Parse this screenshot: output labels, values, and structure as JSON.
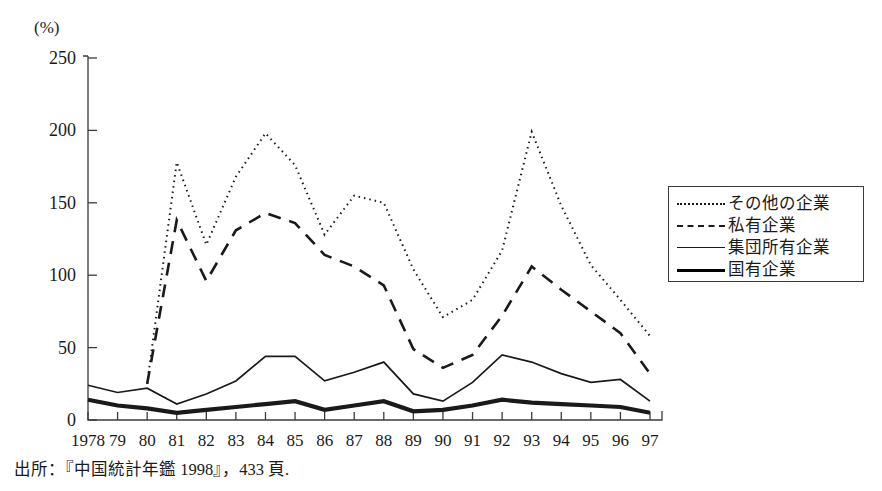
{
  "axis": {
    "y_unit_label": "(%)",
    "y_ticks": [
      0,
      50,
      100,
      150,
      200,
      250
    ],
    "x_tick_labels": [
      "1978",
      "79",
      "80",
      "81",
      "82",
      "83",
      "84",
      "85",
      "86",
      "87",
      "88",
      "89",
      "90",
      "91",
      "92",
      "93",
      "94",
      "95",
      "96",
      "97"
    ]
  },
  "legend": {
    "items": [
      {
        "label": "その他の企業",
        "style": "dotted"
      },
      {
        "label": "私有企業",
        "style": "dashed"
      },
      {
        "label": "集団所有企業",
        "style": "thin-solid"
      },
      {
        "label": "国有企業",
        "style": "thick-solid"
      }
    ]
  },
  "source": {
    "text": "出所：『中国統計年鑑 1998』，433 頁."
  },
  "colors": {
    "line": "#1a1a1a",
    "axis": "#3b3b3b",
    "background": "#ffffff"
  },
  "chart_data": {
    "type": "line",
    "title": "",
    "xlabel": "",
    "ylabel": "(%)",
    "ylim": [
      0,
      250
    ],
    "grid": false,
    "legend_position": "right",
    "categories": [
      "1978",
      "79",
      "80",
      "81",
      "82",
      "83",
      "84",
      "85",
      "86",
      "87",
      "88",
      "89",
      "90",
      "91",
      "92",
      "93",
      "94",
      "95",
      "96",
      "97"
    ],
    "series": [
      {
        "name": "その他の企業",
        "style": "dotted",
        "values": [
          null,
          null,
          25,
          178,
          121,
          168,
          198,
          176,
          128,
          155,
          150,
          104,
          71,
          83,
          117,
          199,
          148,
          107,
          83,
          58
        ]
      },
      {
        "name": "私有企業",
        "style": "dashed",
        "values": [
          null,
          null,
          25,
          138,
          96,
          131,
          143,
          136,
          114,
          106,
          93,
          49,
          36,
          45,
          72,
          106,
          90,
          75,
          60,
          32
        ]
      },
      {
        "name": "集団所有企業",
        "style": "thin-solid",
        "values": [
          24,
          19,
          22,
          11,
          18,
          27,
          44,
          44,
          27,
          33,
          40,
          18,
          13,
          26,
          45,
          40,
          32,
          26,
          28,
          13
        ]
      },
      {
        "name": "国有企業",
        "style": "thick-solid",
        "values": [
          14,
          10,
          8,
          5,
          7,
          9,
          11,
          13,
          7,
          10,
          13,
          6,
          7,
          10,
          14,
          12,
          11,
          10,
          9,
          5
        ]
      }
    ]
  }
}
